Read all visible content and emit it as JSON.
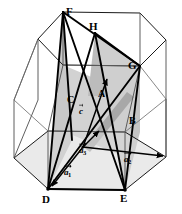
{
  "figure": {
    "kind": "hexagonal-prism-crystal-axes-diagram",
    "background_color": "#ffffff",
    "line_color": "#000000",
    "thin_line_color": "#4d4d4d",
    "plane_fill_light": "#d2d2d2",
    "plane_fill_mid": "#bcbcbc",
    "plane_fill_dark": "#a8a8a8",
    "width": 182,
    "height": 214
  },
  "vertex_labels": [
    {
      "id": "F",
      "text": "F",
      "x": 66,
      "y": 6
    },
    {
      "id": "H",
      "text": "H",
      "x": 89,
      "y": 21
    },
    {
      "id": "G",
      "text": "G",
      "x": 128,
      "y": 60
    },
    {
      "id": "D",
      "text": "D",
      "x": 42,
      "y": 194
    },
    {
      "id": "E",
      "text": "E",
      "x": 120,
      "y": 193
    }
  ],
  "region_labels": [
    {
      "id": "A",
      "text": "A",
      "x": 98,
      "y": 89
    },
    {
      "id": "B",
      "text": "B",
      "x": 129,
      "y": 116
    },
    {
      "id": "C",
      "text": "C",
      "x": 67,
      "y": 95
    }
  ],
  "vector_labels": [
    {
      "id": "c",
      "text": "c",
      "sub": "",
      "x": 79,
      "y": 107
    },
    {
      "id": "a3",
      "text": "a",
      "sub": "3",
      "x": 79,
      "y": 146
    },
    {
      "id": "a2",
      "text": "a",
      "sub": "2",
      "x": 124,
      "y": 155
    },
    {
      "id": "a1",
      "text": "a",
      "sub": "1",
      "x": 64,
      "y": 168
    }
  ],
  "geometry": {
    "top_hexagon": [
      [
        63,
        12
      ],
      [
        140,
        13
      ],
      [
        166,
        40
      ],
      [
        140,
        66
      ],
      [
        63,
        65
      ],
      [
        38,
        39
      ]
    ],
    "bottom_hexagon": [
      [
        48,
        131
      ],
      [
        125,
        132
      ],
      [
        166,
        157
      ],
      [
        125,
        190
      ],
      [
        48,
        189
      ],
      [
        14,
        158
      ]
    ],
    "origin": [
      83,
      147
    ],
    "a1_tip": [
      48,
      189
    ],
    "a2_tip": [
      166,
      157
    ],
    "a3_tip": [
      100,
      130
    ],
    "c_tip": [
      108,
      78
    ],
    "point_D": [
      48,
      189
    ],
    "point_E": [
      125,
      190
    ],
    "point_F": [
      63,
      12
    ],
    "point_G": [
      140,
      66
    ],
    "point_H": [
      95,
      33
    ]
  }
}
